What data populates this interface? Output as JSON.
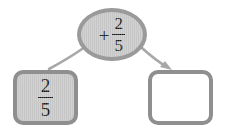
{
  "diagram": {
    "background_color": "#ffffff",
    "operator_node": {
      "name": "operator-bubble",
      "shape": "ellipse",
      "sign": "+",
      "fraction": {
        "numerator": "2",
        "denominator": "5"
      },
      "text": "+ 2/5",
      "fill_color": "#c9c9c9",
      "border_color": "#9a9a9a"
    },
    "input_node": {
      "name": "input-value-box",
      "shape": "rounded-square",
      "fraction": {
        "numerator": "2",
        "denominator": "5"
      },
      "text": "2/5",
      "fill_color": "#c9c9c9",
      "border_color": "#8f8f8f"
    },
    "output_node": {
      "name": "answer-box",
      "shape": "rounded-square",
      "value": "",
      "placeholder": "",
      "fill_color": "#ffffff",
      "border_color": "#8f8f8f"
    },
    "connectors": [
      {
        "name": "input-to-operator-connector",
        "from": "input-value-box",
        "to": "operator-bubble",
        "arrowhead": false,
        "color": "#a8a8a8"
      },
      {
        "name": "operator-to-answer-arrow",
        "from": "operator-bubble",
        "to": "answer-box",
        "arrowhead": true,
        "color": "#a8a8a8"
      }
    ]
  }
}
